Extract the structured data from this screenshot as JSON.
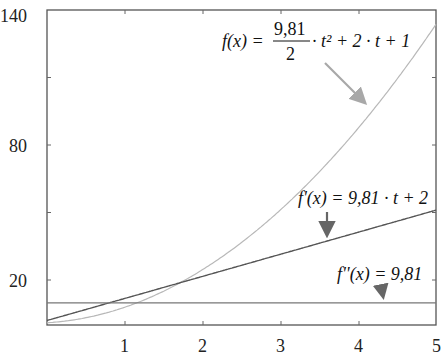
{
  "chart_data": {
    "type": "line",
    "title": "",
    "xlabel": "",
    "ylabel": "",
    "xlim": [
      0,
      5
    ],
    "ylim": [
      0,
      140
    ],
    "grid": false,
    "x_ticks": [
      1,
      2,
      3,
      4,
      5
    ],
    "y_ticks_labeled": [
      20,
      80,
      140
    ],
    "y_ticks_minor": [
      50,
      110
    ],
    "series": [
      {
        "name": "f(x) = 9,81/2 · t² + 2 · t + 1",
        "formula": "4.905*t^2 + 2*t + 1",
        "color": "#b8b8b8",
        "x": [
          0,
          0.5,
          1,
          1.5,
          2,
          2.5,
          3,
          3.5,
          4,
          4.5,
          5
        ],
        "values": [
          1.0,
          3.23,
          7.91,
          15.04,
          30.62,
          36.66,
          51.15,
          68.09,
          87.48,
          109.33,
          133.63
        ]
      },
      {
        "name": "f'(x) = 9,81 · t + 2",
        "formula": "9.81*t + 2",
        "color": "#555555",
        "x": [
          0,
          1,
          2,
          3,
          4,
          5
        ],
        "values": [
          2.0,
          11.81,
          21.62,
          31.43,
          41.24,
          51.05
        ]
      },
      {
        "name": "f''(x) = 9,81",
        "formula": "9.81",
        "color": "#777777",
        "x": [
          0,
          5
        ],
        "values": [
          9.81,
          9.81
        ]
      }
    ],
    "annotations": [
      {
        "text": "f(x) = 9,81/2 · t² + 2 · t + 1",
        "target_series": 0
      },
      {
        "text": "f'(x) = 9,81 · t + 2",
        "target_series": 1
      },
      {
        "text": "f''(x) = 9,81",
        "target_series": 2
      }
    ]
  },
  "labels": {
    "y": {
      "t140": "140",
      "t80": "80",
      "t20": "20"
    },
    "x": {
      "t1": "1",
      "t2": "2",
      "t3": "3",
      "t4": "4",
      "t5": "5"
    },
    "f": {
      "lhs": "f(x) =",
      "num": "9,81",
      "den": "2",
      "rest": "· t² + 2 · t + 1"
    },
    "fp": {
      "text": "f'(x) = 9,81 · t + 2"
    },
    "fpp": {
      "text": "f''(x) = 9,81"
    }
  }
}
